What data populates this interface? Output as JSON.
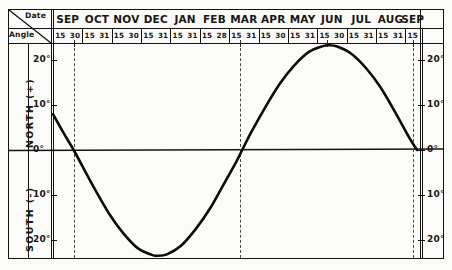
{
  "table_header": {
    "corner_date_label": "Date",
    "corner_angle_label": "Angle",
    "months": [
      {
        "name": "SEP",
        "days": [
          "15",
          "30"
        ]
      },
      {
        "name": "OCT",
        "days": [
          "15",
          "31"
        ]
      },
      {
        "name": "NOV",
        "days": [
          "15",
          "30"
        ]
      },
      {
        "name": "DEC",
        "days": [
          "15",
          "31"
        ]
      },
      {
        "name": "JAN",
        "days": [
          "15",
          "31"
        ]
      },
      {
        "name": "FEB",
        "days": [
          "15",
          "28"
        ]
      },
      {
        "name": "MAR",
        "days": [
          "15",
          "31"
        ]
      },
      {
        "name": "APR",
        "days": [
          "15",
          "30"
        ]
      },
      {
        "name": "MAY",
        "days": [
          "15",
          "31"
        ]
      },
      {
        "name": "JUN",
        "days": [
          "15",
          "30"
        ]
      },
      {
        "name": "JUL",
        "days": [
          "15",
          "31"
        ]
      },
      {
        "name": "AUG",
        "days": [
          "15",
          "31"
        ]
      },
      {
        "name": "SEP",
        "days": [
          "15"
        ]
      }
    ]
  },
  "y_axis": {
    "upper_label": "NORTH (+)",
    "lower_label": "SOUTH (-)",
    "left_ticks": [
      "20°",
      "10°",
      "0°",
      "10°",
      "20°"
    ],
    "right_ticks": [
      "20°",
      "10°",
      "0°",
      "10°",
      "20°"
    ]
  },
  "colors": {
    "ink": "#15130f",
    "curve": "#0d0c0a",
    "dashed": "#4a4843",
    "paper": "#fbfbf9"
  },
  "chart_data": {
    "type": "line",
    "title": "",
    "xlabel": "Date",
    "ylabel": "Angle",
    "ylim": [
      -23.5,
      23.5
    ],
    "grid": false,
    "legend": "none",
    "x": [
      "SEP 1",
      "SEP 15",
      "SEP 23",
      "OCT 15",
      "OCT 31",
      "NOV 15",
      "NOV 30",
      "DEC 15",
      "DEC 21",
      "DEC 31",
      "JAN 15",
      "JAN 31",
      "FEB 15",
      "FEB 28",
      "MAR 15",
      "MAR 21",
      "MAR 31",
      "APR 15",
      "APR 30",
      "MAY 15",
      "MAY 31",
      "JUN 15",
      "JUN 21",
      "JUN 30",
      "JUL 15",
      "JUL 31",
      "AUG 15",
      "AUG 31",
      "SEP 15",
      "SEP 23"
    ],
    "values": [
      8.0,
      2.8,
      0.0,
      -8.5,
      -14.2,
      -18.5,
      -21.7,
      -23.2,
      -23.4,
      -23.1,
      -21.2,
      -17.4,
      -12.9,
      -8.1,
      -2.5,
      0.0,
      4.1,
      9.7,
      14.8,
      18.8,
      21.9,
      23.2,
      23.4,
      23.1,
      21.5,
      18.2,
      14.0,
      8.3,
      2.6,
      0.0
    ],
    "series": [
      {
        "name": "Solar declination",
        "values": [
          8.0,
          2.8,
          0.0,
          -8.5,
          -14.2,
          -18.5,
          -21.7,
          -23.2,
          -23.4,
          -23.1,
          -21.2,
          -17.4,
          -12.9,
          -8.1,
          -2.5,
          0.0,
          4.1,
          9.7,
          14.8,
          18.8,
          21.9,
          23.2,
          23.4,
          23.1,
          21.5,
          18.2,
          14.0,
          8.3,
          2.6,
          0.0
        ]
      }
    ],
    "annotations": [
      {
        "type": "dashed-vline",
        "label": "SEP 23 equinox"
      },
      {
        "type": "dashed-vline",
        "label": "MAR 21 equinox"
      },
      {
        "type": "tick",
        "label": "JUN 21 solstice"
      },
      {
        "type": "dashed-vline",
        "label": "SEP 23 equinox"
      }
    ]
  }
}
